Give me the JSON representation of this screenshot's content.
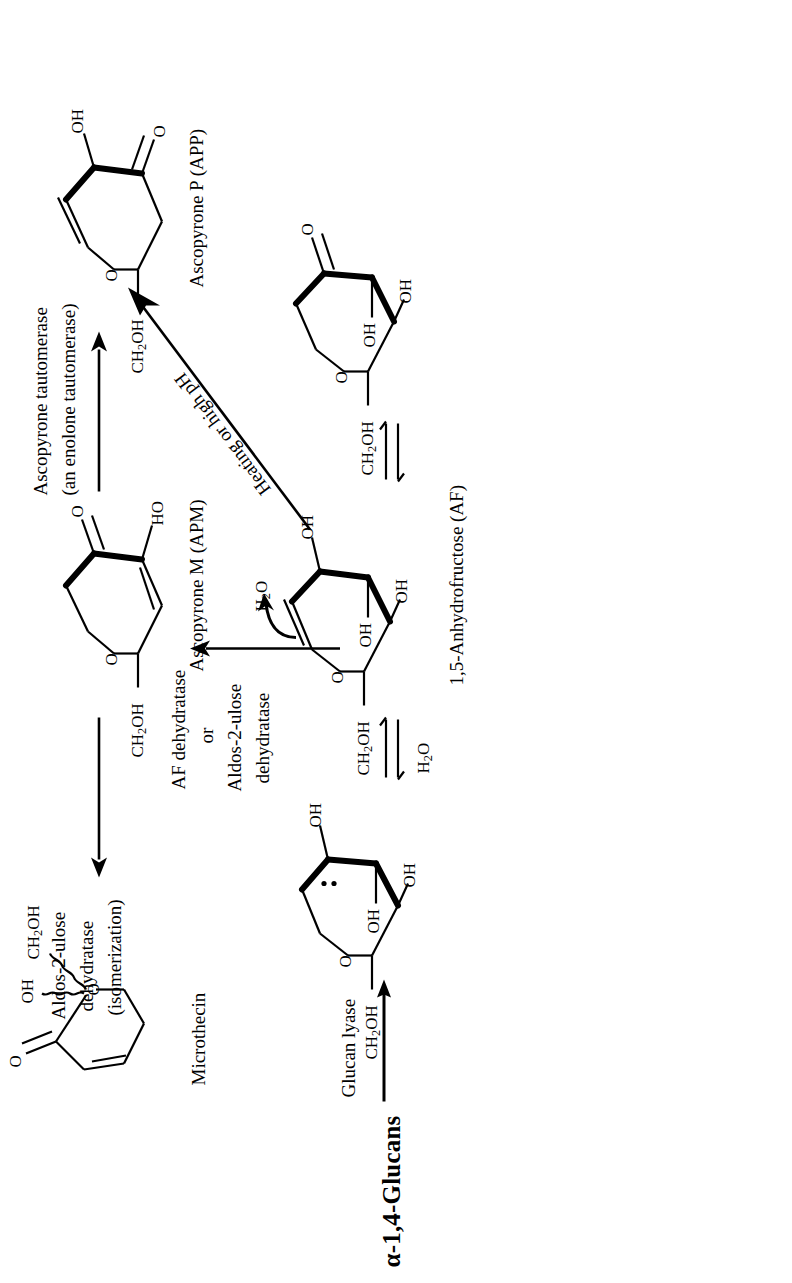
{
  "scheme": {
    "title": "Ascopyrone / 1,5-anhydrofructose biochemical pathway",
    "orientation_degrees": -90,
    "background_color": "#ffffff",
    "ink_color": "#000000"
  },
  "compounds": {
    "glucans": {
      "label": "α-1,4-Glucans"
    },
    "af": {
      "label": "1,5-Anhydrofructose (AF)"
    },
    "apm": {
      "label": "Ascopyrone M (APM)"
    },
    "app": {
      "label": "Ascopyrone P (APP)"
    },
    "microthecin": {
      "label": "Microthecin"
    }
  },
  "enzymes": {
    "glucan_lyase": {
      "label": "Glucan lyase"
    },
    "af_dehydratase": {
      "line1": "AF dehydratase",
      "line2": "or",
      "line3": "Aldos-2-ulose",
      "line4": "dehydratase"
    },
    "aldos_isomerization": {
      "line1": "Aldos-2-ulose",
      "line2": "dehydratase",
      "line3": "(isomerization)"
    },
    "ascopyrone_tautomerase": {
      "line1": "Ascopyrone tautomerase",
      "line2": "(an enolone tautomerase)"
    },
    "heating": {
      "label": "Heating or high pH"
    }
  },
  "small_molecules": {
    "water_left": {
      "formula": "H",
      "sub": "2",
      "formula_end": "O"
    },
    "water_right": {
      "formula": "H",
      "sub": "2",
      "formula_end": "O"
    },
    "water_loss": {
      "formula": "H",
      "sub": "2",
      "formula_end": "O"
    }
  },
  "atom_labels": {
    "O": "O",
    "OH": "OH",
    "HO": "HO",
    "CH2OH_pre": "CH",
    "CH2OH_sub": "2",
    "CH2OH_post": "OH",
    "lone_pair": "⋮"
  },
  "structures": {
    "hydrate": {
      "name": "AF hydrate (gem-diol) pyranose",
      "labels": [
        "CH2OH",
        "O",
        "OH",
        "OH",
        "OH"
      ],
      "has_lone_pair_dots": true
    },
    "af_enol": {
      "name": "1,5-Anhydrofructose enol/keto depiction",
      "labels": [
        "CH2OH",
        "O",
        "OH",
        "OH",
        "OH"
      ]
    },
    "af_keto": {
      "name": "1,5-Anhydrofructose keto tautomer",
      "labels": [
        "CH2OH",
        "O",
        "OH",
        "OH",
        "O"
      ]
    },
    "apm": {
      "name": "Ascopyrone M",
      "labels": [
        "CH2OH",
        "O",
        "O",
        "HO"
      ]
    },
    "app": {
      "name": "Ascopyrone P",
      "labels": [
        "CH2OH",
        "O",
        "OH",
        "O"
      ]
    },
    "microthecin": {
      "name": "Microthecin",
      "labels": [
        "O",
        "OH",
        "CH2OH",
        "O"
      ],
      "wavy_bonds": 2
    }
  },
  "arrows": {
    "glucan_to_af": {
      "type": "single",
      "direction": "right"
    },
    "hydrate_equilibrium": {
      "type": "equilibrium"
    },
    "keto_equilibrium": {
      "type": "equilibrium"
    },
    "af_to_apm": {
      "type": "single",
      "direction": "right"
    },
    "apm_to_app": {
      "type": "single",
      "direction": "right"
    },
    "apm_to_microthecin": {
      "type": "single",
      "direction": "right"
    },
    "af_to_app_diagonal": {
      "type": "single",
      "direction": "up-right"
    },
    "water_loss_curved": {
      "type": "curved",
      "direction": "up"
    }
  }
}
